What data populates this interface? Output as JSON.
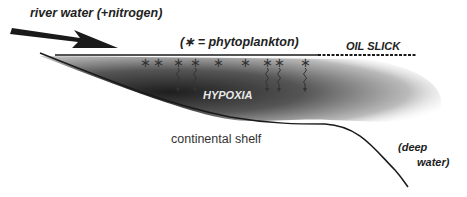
{
  "diagram": {
    "labels": {
      "river": "river water (+nitrogen)",
      "legend": "(∗ = phytoplankton)",
      "oil_slick": "OIL SLICK",
      "hypoxia": "HYPOXIA",
      "shelf": "continental shelf",
      "deep_1": "(deep",
      "deep_2": "water)"
    },
    "phytoplankton_symbol": "∗",
    "phytoplankton_x": [
      145,
      158,
      178,
      195,
      218,
      245,
      267,
      279,
      305
    ],
    "sinking_x": [
      178,
      195,
      267,
      279,
      305
    ],
    "colors": {
      "line": "#1a1a1a",
      "hypoxia_dark": "#1e1e1e",
      "text": "#222222"
    }
  }
}
